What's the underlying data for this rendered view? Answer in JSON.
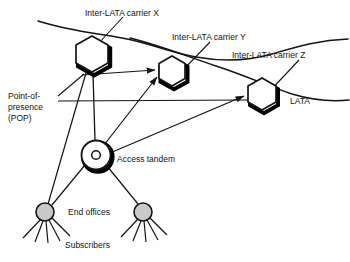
{
  "figure": {
    "type": "network-topology-diagram",
    "background_color": "#fefefe",
    "line_color": "#141414",
    "shadow_color": "#000000",
    "end_office_fill": "#c9c9c9"
  },
  "labels": {
    "carrier_x": "Inter-LATA carrier X",
    "carrier_y": "Inter-LATA carrier Y",
    "carrier_z": "Inter-LATA carrier Z",
    "lata": "LATA",
    "pop_line1": "Point-of-",
    "pop_line2": "presence",
    "pop_line3": "(POP)",
    "access_tandem": "Access tandem",
    "end_offices": "End offices",
    "subscribers": "Subscribers"
  },
  "nodes": [
    {
      "id": "pop-x",
      "name": "point-of-presence-x",
      "shape": "hexagon",
      "cx": 90,
      "cy": 54,
      "r": 19
    },
    {
      "id": "pop-y",
      "name": "point-of-presence-y",
      "shape": "hexagon",
      "cx": 172,
      "cy": 72,
      "r": 16
    },
    {
      "id": "pop-z",
      "name": "point-of-presence-z",
      "shape": "hexagon",
      "cx": 262,
      "cy": 95,
      "r": 17
    },
    {
      "id": "access-tandem",
      "name": "access-tandem",
      "shape": "circle",
      "cx": 96,
      "cy": 155,
      "r": 15
    },
    {
      "id": "end-office-1",
      "name": "end-office-left",
      "shape": "circle-filled",
      "cx": 45,
      "cy": 212,
      "r": 9
    },
    {
      "id": "end-office-2",
      "name": "end-office-right",
      "shape": "circle-filled",
      "cx": 143,
      "cy": 212,
      "r": 9
    }
  ],
  "edges": [
    {
      "from": "pop-x",
      "to": "pop-y",
      "arrow": true
    },
    {
      "from": "pop-x",
      "to": "pop-z",
      "arrow": true
    },
    {
      "from": "access-tandem",
      "to": "pop-x",
      "arrow": false
    },
    {
      "from": "access-tandem",
      "to": "pop-y",
      "arrow": true
    },
    {
      "from": "access-tandem",
      "to": "pop-z",
      "arrow": true
    },
    {
      "from": "pop-x",
      "to": "end-office-1",
      "arrow": false
    },
    {
      "from": "access-tandem",
      "to": "end-office-1",
      "arrow": false
    },
    {
      "from": "access-tandem",
      "to": "end-office-2",
      "arrow": false
    }
  ],
  "boundaries": [
    {
      "name": "lata-boundary-upper",
      "description": "wavy LATA boundary line across the top"
    },
    {
      "name": "lata-boundary-lower",
      "description": "wavy LATA boundary line on the right"
    }
  ],
  "subscriber_lines": {
    "end_office_left_count": 5,
    "end_office_right_count": 5
  }
}
